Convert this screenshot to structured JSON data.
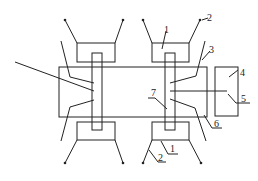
{
  "diagram": {
    "type": "mechanical schematic",
    "labels": {
      "l1_top": "1",
      "l2_top": "2",
      "l3": "3",
      "l4": "4",
      "l5": "5",
      "l6": "6",
      "l7": "7",
      "l1_bottom": "1",
      "l2_bottom": "2"
    },
    "components": [
      {
        "id": "1",
        "name": "leg block"
      },
      {
        "id": "2",
        "name": "leg"
      },
      {
        "id": "3",
        "name": "upper inner arm"
      },
      {
        "id": "4",
        "name": "side box"
      },
      {
        "id": "5",
        "name": "connecting rod"
      },
      {
        "id": "6",
        "name": "lower inner arm"
      },
      {
        "id": "7",
        "name": "shaft"
      }
    ],
    "colors": {
      "stroke": "#222222",
      "background": "#ffffff"
    }
  }
}
